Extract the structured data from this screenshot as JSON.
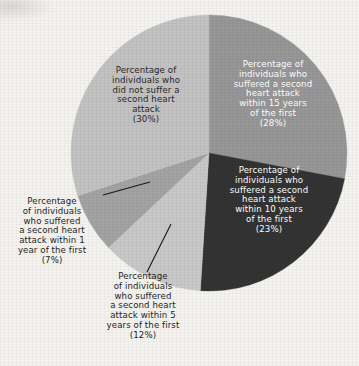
{
  "chart_data": {
    "type": "pie",
    "title": "",
    "subtitle": "",
    "xlabel": "",
    "ylabel": "",
    "legend_position": "none",
    "grid": false,
    "units": "percent",
    "total": 100,
    "categories": [
      "Percentage of individuals who suffered a second heart attack within 15 years of the first",
      "Percentage of individuals who suffered a second heart attack within 10 years of the first",
      "Percentage of individuals who suffered a second heart attack within 5 years of the first",
      "Percentage of individuals who suffered a second heart attack within 1 year of the first",
      "Percentage of individuals who did not suffer a second heart attack"
    ],
    "values": [
      28,
      23,
      12,
      7,
      30
    ],
    "slices": [
      {
        "id": "within-15-years",
        "label": "Percentage of\nindividuals who\nsuffered a second\nheart attack\nwithin 15 years\nof the first\n(28%)",
        "value": 28,
        "percent_text": "(28%)",
        "color": "#979797",
        "text_color": "#ffffff",
        "label_placement": "inside",
        "start_angle_deg": 0,
        "end_angle_deg": 100.8
      },
      {
        "id": "within-10-years",
        "label": "Percentage of\nindividuals who\nsuffered a second\nheart attack\nwithin 10 years\nof the first\n(23%)",
        "value": 23,
        "percent_text": "(23%)",
        "color": "#333333",
        "text_color": "#ffffff",
        "label_placement": "inside",
        "start_angle_deg": 100.8,
        "end_angle_deg": 183.6
      },
      {
        "id": "within-5-years",
        "label": "Percentage\nof individuals\nwho suffered\na second heart\nattack within 5\nyears of the first\n(12%)",
        "value": 12,
        "percent_text": "(12%)",
        "color": "#c8c8c8",
        "text_color": "#1f1f1f",
        "label_placement": "outside",
        "start_angle_deg": 183.6,
        "end_angle_deg": 226.8
      },
      {
        "id": "within-1-year",
        "label": "Percentage\nof individuals\nwho suffered\na second heart\nattack within 1\nyear of the first\n(7%)",
        "value": 7,
        "percent_text": "(7%)",
        "color": "#a3a3a3",
        "text_color": "#1f1f1f",
        "label_placement": "outside",
        "start_angle_deg": 226.8,
        "end_angle_deg": 252.0
      },
      {
        "id": "no-second-attack",
        "label": "Percentage of\nindividuals who\ndid not suffer a\nsecond heart\nattack\n(30%)",
        "value": 30,
        "percent_text": "(30%)",
        "color": "#c2c2c2",
        "text_color": "#2a2a2a",
        "label_placement": "inside",
        "start_angle_deg": 252.0,
        "end_angle_deg": 360.0
      }
    ],
    "geometry": {
      "center_x": 209,
      "center_y": 153,
      "radius": 138
    },
    "background_color": "#f4f3f0",
    "leader_line_color": "#1a1a1a"
  }
}
